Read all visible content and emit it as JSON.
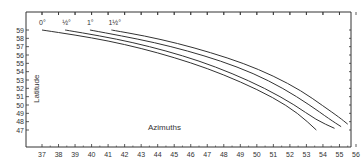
{
  "chart_data": {
    "type": "line",
    "title": "",
    "xlabel": "Azimuths",
    "ylabel": "Latitude",
    "xlim": [
      36,
      56.3
    ],
    "ylim": [
      45,
      60.5
    ],
    "x_ticks": [
      37,
      38,
      39,
      40,
      41,
      42,
      43,
      44,
      45,
      46,
      47,
      48,
      49,
      50,
      51,
      52,
      53,
      54,
      55,
      56
    ],
    "y_ticks": [
      47,
      48,
      49,
      50,
      51,
      52,
      53,
      54,
      55,
      56,
      57,
      58,
      59
    ],
    "grid": false,
    "legend": "curve labels at top of each line",
    "series": [
      {
        "name": "0°",
        "label": "0°",
        "points": [
          [
            37.0,
            59.0
          ],
          [
            39.0,
            58.4
          ],
          [
            41.0,
            57.7
          ],
          [
            43.0,
            56.8
          ],
          [
            45.0,
            55.7
          ],
          [
            47.0,
            54.4
          ],
          [
            49.0,
            52.8
          ],
          [
            51.0,
            50.9
          ],
          [
            52.5,
            49.0
          ],
          [
            53.6,
            47.0
          ]
        ]
      },
      {
        "name": "½°",
        "label": "½°",
        "points": [
          [
            38.4,
            59.0
          ],
          [
            40.5,
            58.3
          ],
          [
            42.5,
            57.5
          ],
          [
            44.5,
            56.5
          ],
          [
            46.5,
            55.3
          ],
          [
            48.5,
            53.8
          ],
          [
            50.5,
            52.0
          ],
          [
            52.3,
            50.0
          ],
          [
            53.6,
            48.2
          ],
          [
            54.7,
            47.2
          ]
        ]
      },
      {
        "name": "1°",
        "label": "1°",
        "points": [
          [
            39.9,
            59.0
          ],
          [
            41.8,
            58.3
          ],
          [
            43.8,
            57.5
          ],
          [
            45.8,
            56.5
          ],
          [
            47.8,
            55.3
          ],
          [
            49.8,
            53.8
          ],
          [
            51.6,
            52.0
          ],
          [
            53.2,
            50.0
          ],
          [
            54.4,
            48.3
          ],
          [
            55.1,
            47.4
          ]
        ]
      },
      {
        "name": "1½°",
        "label": "1½°",
        "points": [
          [
            41.2,
            59.0
          ],
          [
            43.2,
            58.3
          ],
          [
            45.2,
            57.4
          ],
          [
            47.2,
            56.3
          ],
          [
            49.2,
            55.0
          ],
          [
            51.0,
            53.5
          ],
          [
            52.7,
            51.7
          ],
          [
            54.0,
            49.9
          ],
          [
            55.0,
            48.5
          ],
          [
            55.5,
            47.7
          ]
        ]
      }
    ]
  },
  "axes": {
    "x_title": "Azimuths",
    "y_title": "Latitude"
  }
}
